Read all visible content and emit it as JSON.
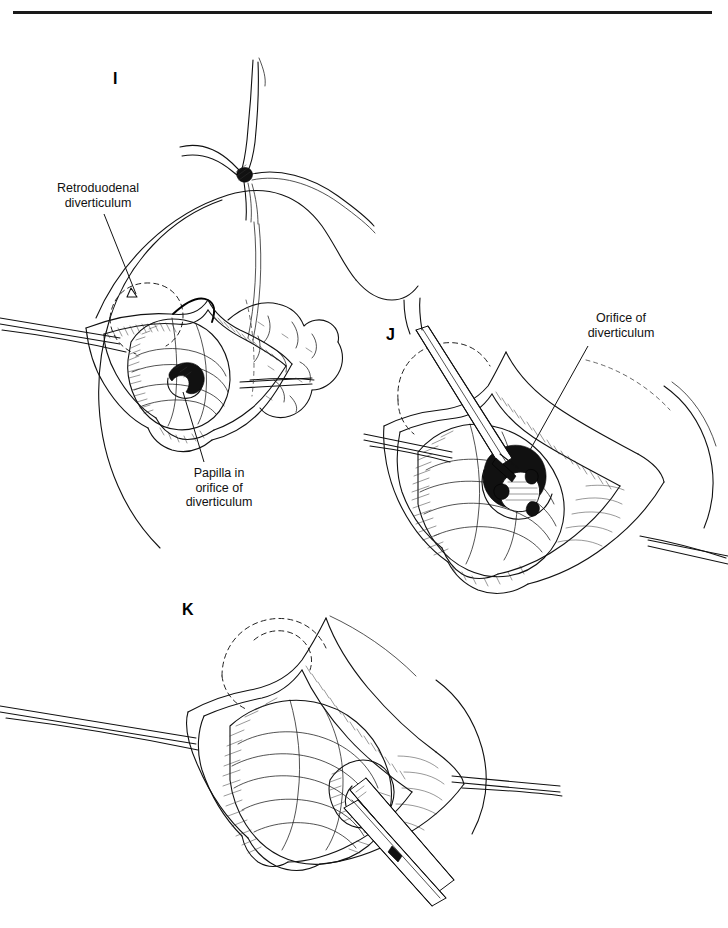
{
  "page": {
    "background_color": "#ffffff",
    "ink_color": "#111111",
    "rule_color": "#1a1a1a",
    "width": 728,
    "height": 928
  },
  "panels": [
    {
      "id": "panel-i",
      "letter": "I",
      "description": "Duodenotomy opened with stay sutures showing bulging retroduodenal diverticulum and papilla within its orifice"
    },
    {
      "id": "panel-j",
      "letter": "J",
      "description": "Probe inserted into the orifice of the diverticulum beside the papilla"
    },
    {
      "id": "panel-k",
      "letter": "K",
      "description": "Forceps grasping and inverting the diverticulum through the duodenotomy"
    }
  ],
  "labels": [
    {
      "id": "label-retroduodenal",
      "lines": [
        "Retroduodenal",
        "diverticulum"
      ],
      "text": "Retroduodenal diverticulum",
      "panel": "I"
    },
    {
      "id": "label-papilla",
      "lines": [
        "Papilla in",
        "orifice of",
        "diverticulum"
      ],
      "text": "Papilla in orifice of diverticulum",
      "panel": "I"
    },
    {
      "id": "label-orifice",
      "lines": [
        "Orifice of",
        "diverticulum"
      ],
      "text": "Orifice of diverticulum",
      "panel": "J"
    }
  ]
}
